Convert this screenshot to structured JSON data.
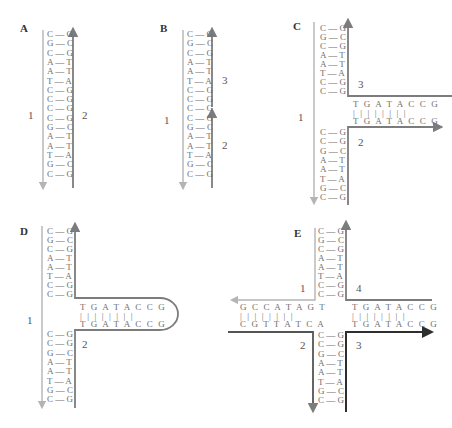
{
  "colors": {
    "strand_light": "#b4b4b4",
    "strand_medium": "#7c7c7c",
    "strand_dark": "#2e2e2e",
    "text": "#6f6f6f",
    "label": "#333333"
  },
  "panels": {
    "A": {
      "label": "A",
      "pairs": [
        "C — G",
        "G — C",
        "C — G",
        "A — T",
        "A — T",
        "T — A",
        "C — G",
        "C — G",
        "C — G",
        "C — G",
        "G — C",
        "A — T",
        "A — T",
        "T — A",
        "G — C",
        "C — G"
      ],
      "strand_labels": {
        "left": "1",
        "right": "2"
      }
    },
    "B": {
      "label": "B",
      "pairs": [
        "C — G",
        "G — C",
        "C — G",
        "A — T",
        "A — T",
        "T — A",
        "C — G",
        "C — G",
        "C — G",
        "C — G",
        "G — C",
        "A — T",
        "A — T",
        "T — A",
        "G — C",
        "C — G"
      ],
      "strand_labels": {
        "left": "1",
        "right_upper": "3",
        "right_lower": "2"
      }
    },
    "C": {
      "label": "C",
      "upper_pairs": [
        "C — G",
        "G — C",
        "C — G",
        "A — T",
        "A — T",
        "T — A",
        "C — G",
        "C — G"
      ],
      "lower_pairs": [
        "C — G",
        "C — G",
        "G — C",
        "A — T",
        "A — T",
        "T — A",
        "G — C",
        "C — G"
      ],
      "hairpin_top": "T G A T A C C G",
      "hairpin_bonds": "| | | | | | | |",
      "hairpin_bottom": "T G A T A C C G",
      "strand_labels": {
        "left": "1",
        "upper_right": "3",
        "lower_right": "2"
      }
    },
    "D": {
      "label": "D",
      "upper_pairs": [
        "C — G",
        "G — C",
        "C — G",
        "A — T",
        "A — T",
        "T — A",
        "C — G",
        "C — G"
      ],
      "lower_pairs": [
        "C — G",
        "C — G",
        "G — C",
        "A — T",
        "A — T",
        "T — A",
        "G — C",
        "C — G"
      ],
      "loop_top": "T G A T A C C G",
      "loop_bonds": "| | | | | | | |",
      "loop_bottom": "T G A T A C C G",
      "strand_labels": {
        "left": "1",
        "right": "2"
      }
    },
    "E": {
      "label": "E",
      "upper_pairs": [
        "C — G",
        "G — C",
        "C — G",
        "A — T",
        "A — T",
        "T — A",
        "C — G",
        "C — G"
      ],
      "lower_pairs": [
        "C — G",
        "C — G",
        "G — C",
        "A — T",
        "A — T",
        "T — A",
        "G — C",
        "C — G"
      ],
      "left_top": "G C C A T A G T",
      "left_bonds": "| | | | | | | |",
      "left_bottom": "C G T T A T C A",
      "right_top": "T G A T A C C G",
      "right_bonds": "| | | | | | | |",
      "right_bottom": "T G A T A C C G",
      "strand_labels": {
        "upper_left": "1",
        "upper_right": "4",
        "lower_left": "2",
        "lower_right": "3"
      }
    }
  }
}
